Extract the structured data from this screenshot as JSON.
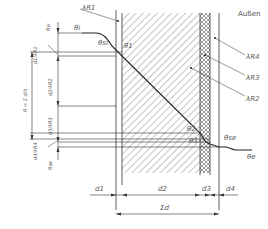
{
  "labels": {
    "outside": "Außen",
    "lambda_r1": "λR1",
    "lambda_r2": "λR2",
    "lambda_r3": "λR3",
    "lambda_r4": "λR4",
    "theta_i": "θi",
    "theta_si": "θsi",
    "theta_1": "θ1",
    "theta_2": "θ2",
    "theta_3": "θ3",
    "theta_se": "θse",
    "theta_e": "θe",
    "r_si": "Rsi",
    "r_se": "Rse",
    "r_sum": "R = Σ d/λ",
    "d1_l1": "d1/λR1",
    "d2_l2": "d2/λR2",
    "d3_l3": "d3/λR3",
    "d4_l4": "d4/λR4",
    "d1": "d1",
    "d2": "d2",
    "d3": "d3",
    "d4": "d4",
    "sum_d": "Σd"
  },
  "colors": {
    "line": "#333333",
    "text": "#555555",
    "background": "#ffffff"
  }
}
